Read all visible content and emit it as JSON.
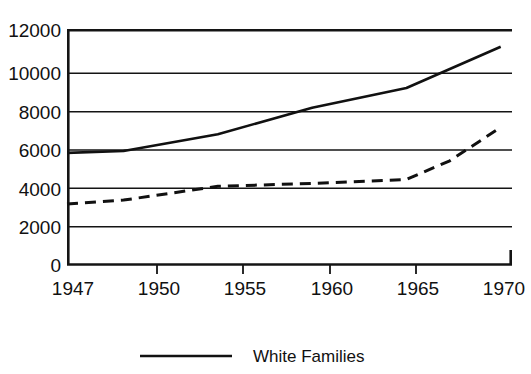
{
  "chart_data": {
    "type": "line",
    "title": "",
    "subtitle": "",
    "xlabel": "",
    "ylabel": "",
    "x": [
      1947,
      1950,
      1955,
      1960,
      1965,
      1970
    ],
    "xlim": [
      1947,
      1970.6
    ],
    "ylim": [
      0,
      12000
    ],
    "grid": true,
    "grid_axis": "y",
    "legend_position": "bottom",
    "x_tick_labels": [
      "1947",
      "1950",
      "1955",
      "1960",
      "1965",
      "1970"
    ],
    "y_tick_labels": [
      "0",
      "2000",
      "4000",
      "6000",
      "8000",
      "10000",
      "12000"
    ],
    "y_ticks": [
      0,
      2000,
      4000,
      6000,
      8000,
      10000,
      12000
    ],
    "series": [
      {
        "name": "White Families",
        "style": "solid",
        "color": "#111111",
        "x": [
          1947,
          1950,
          1955,
          1960,
          1965,
          1970
        ],
        "values": [
          5700,
          5800,
          6650,
          8000,
          9000,
          11100
        ]
      },
      {
        "name": "",
        "style": "dashed",
        "color": "#111111",
        "x": [
          1947,
          1950,
          1955,
          1960,
          1965,
          1967.3,
          1970
        ],
        "values": [
          3100,
          3300,
          4000,
          4150,
          4350,
          5300,
          7000
        ]
      }
    ],
    "legend_entries": [
      {
        "label": "White Families",
        "style": "solid",
        "color": "#111111"
      }
    ]
  },
  "axis": {
    "y_labels": {
      "v12000": "12000",
      "v10000": "10000",
      "v8000": "8000",
      "v6000": "6000",
      "v4000": "4000",
      "v2000": "2000",
      "v0": "0"
    },
    "x_labels": {
      "y1947": "1947",
      "y1950": "1950",
      "y1955": "1955",
      "y1960": "1960",
      "y1965": "1965",
      "y1970": "1970"
    }
  },
  "legend": {
    "entry_1_label": "White Families"
  }
}
